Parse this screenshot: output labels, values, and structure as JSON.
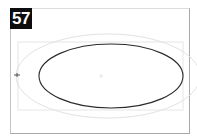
{
  "figure": {
    "number_label": "57",
    "colors": {
      "badge_bg": "#0d0d0d",
      "badge_text": "#ffffff",
      "frame": "#a8a8a8",
      "inner_rect": "#e6e6e6",
      "guide_ellipse": "#e2e2e2",
      "main_ellipse": "#2a2a2a"
    }
  },
  "shapes": {
    "inner_rect": {
      "x": 18,
      "y": 42,
      "width": 165,
      "height": 68
    },
    "guide_ellipse": {
      "cx": 108,
      "cy": 76,
      "rx": 92,
      "ry": 42
    },
    "main_ellipse": {
      "cx": 111,
      "cy": 76,
      "rx": 72,
      "ry": 32
    },
    "center_marker": {
      "x": 101,
      "y": 76
    },
    "left_marker": {
      "x": 17,
      "y": 75
    }
  }
}
